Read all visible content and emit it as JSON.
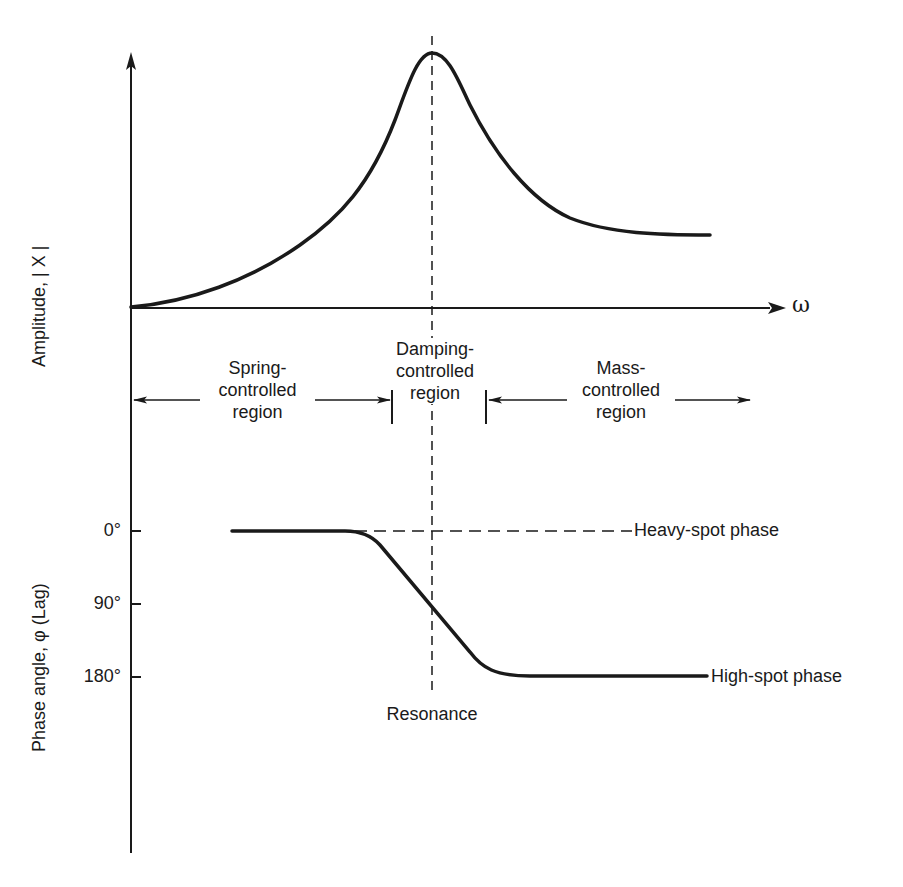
{
  "amplitude_plot": {
    "y_axis_label": "Amplitude, | X |",
    "x_axis_symbol": "ω",
    "curve": "resonance amplitude response",
    "resonance_marker": "dashed vertical line at peak"
  },
  "regions": [
    {
      "line1": "Spring-",
      "line2": "controlled",
      "line3": "region"
    },
    {
      "line1": "Damping-",
      "line2": "controlled",
      "line3": "region"
    },
    {
      "line1": "Mass-",
      "line2": "controlled",
      "line3": "region"
    }
  ],
  "phase_plot": {
    "y_axis_label": "Phase angle, φ (Lag)",
    "ticks": [
      "0°",
      "90°",
      "180°"
    ],
    "heavy_spot_label": "Heavy-spot phase",
    "high_spot_label": "High-spot phase",
    "resonance_label": "Resonance"
  },
  "colors": {
    "ink": "#1a1a1a",
    "background": "#ffffff"
  }
}
